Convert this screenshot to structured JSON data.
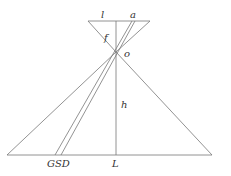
{
  "diagram": {
    "labels": {
      "l": "l",
      "a": "a",
      "f": "f",
      "o": "o",
      "h": "h",
      "gsd": "GSD",
      "L": "L"
    },
    "colors": {
      "line": "#777777",
      "text": "#333333",
      "background": "#ffffff"
    }
  }
}
